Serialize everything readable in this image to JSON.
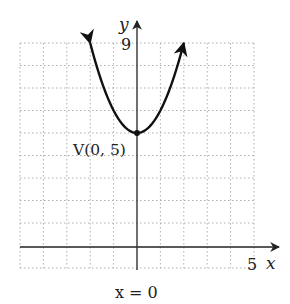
{
  "chart_data": {
    "type": "line",
    "title": "",
    "xlabel": "x",
    "ylabel": "y",
    "xlim": [
      -5,
      5
    ],
    "ylim": [
      -1,
      9
    ],
    "grid": true,
    "grid_style": "dotted",
    "tick_labels": {
      "x": [
        "5"
      ],
      "y": [
        "9"
      ]
    },
    "series": [
      {
        "name": "parabola",
        "equation": "y = x^2 + 5",
        "x": [
          -2,
          -1.5,
          -1,
          -0.5,
          0,
          0.5,
          1,
          1.5,
          2
        ],
        "y": [
          9,
          7.25,
          6,
          5.25,
          5,
          5.25,
          6,
          7.25,
          9
        ],
        "arrows_at_ends": true
      }
    ],
    "annotations": [
      {
        "text": "V(0, 5)",
        "x": 0,
        "y": 5,
        "type": "vertex-point"
      },
      {
        "text": "x = 0",
        "type": "axis-of-symmetry-label"
      }
    ]
  },
  "labels": {
    "y_axis": "y",
    "x_axis": "x",
    "y_tick": "9",
    "x_tick": "5",
    "vertex": "V(0, 5)",
    "axis_of_symmetry": "x = 0"
  },
  "colors": {
    "curve": "#111111",
    "axis": "#333333",
    "grid": "#9a9a9a"
  }
}
